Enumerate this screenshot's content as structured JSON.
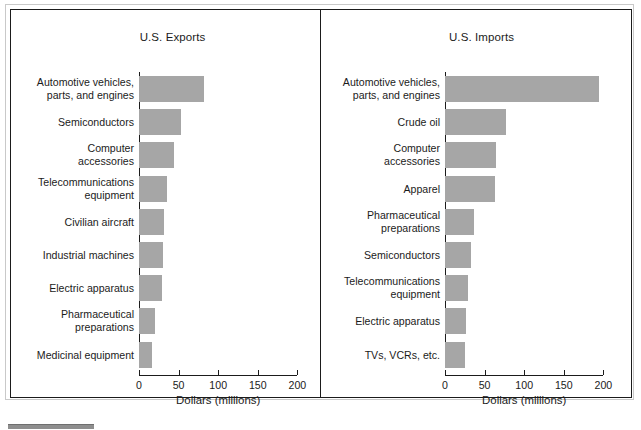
{
  "figure": {
    "panels": [
      {
        "id": "exports",
        "title": "U.S. Exports"
      },
      {
        "id": "imports",
        "title": "U.S. Imports"
      }
    ],
    "axis_title": "Dollars (millions)",
    "tick_labels": [
      "0",
      "50",
      "100",
      "150",
      "200"
    ],
    "bar_color": "#a6a6a6",
    "frame_color": "#1b1b1b"
  },
  "chart_data": [
    {
      "type": "bar",
      "title": "U.S. Exports",
      "orientation": "horizontal",
      "xlabel": "Dollars (millions)",
      "ylabel": "",
      "xlim": [
        0,
        200
      ],
      "xticks": [
        0,
        50,
        100,
        150,
        200
      ],
      "grid": false,
      "legend": "none",
      "categories": [
        "Automotive vehicles,\nparts, and engines",
        "Semiconductors",
        "Computer\naccessories",
        "Telecommunications\nequipment",
        "Civilian aircraft",
        "Industrial machines",
        "Electric apparatus",
        "Pharmaceutical\npreparations",
        "Medicinal equipment"
      ],
      "values": [
        82,
        53,
        44,
        35,
        31,
        30,
        29,
        20,
        17
      ]
    },
    {
      "type": "bar",
      "title": "U.S. Imports",
      "orientation": "horizontal",
      "xlabel": "Dollars (millions)",
      "ylabel": "",
      "xlim": [
        0,
        200
      ],
      "xticks": [
        0,
        50,
        100,
        150,
        200
      ],
      "grid": false,
      "legend": "none",
      "categories": [
        "Automotive vehicles,\nparts, and engines",
        "Crude oil",
        "Computer\naccessories",
        "Apparel",
        "Pharmaceutical\npreparations",
        "Semiconductors",
        "Telecommunications\nequipment",
        "Electric apparatus",
        "TVs, VCRs, etc."
      ],
      "values": [
        194,
        77,
        64,
        63,
        37,
        33,
        29,
        26,
        25
      ]
    }
  ]
}
